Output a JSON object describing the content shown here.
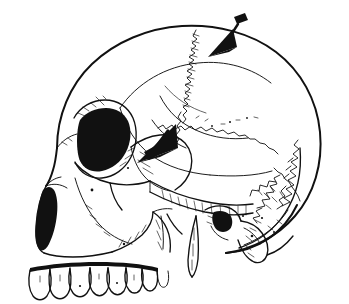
{
  "figure": {
    "kind": "anatomical-line-drawing",
    "view": "lateral (left side) view",
    "background_color": "#ffffff",
    "ink_color": "#111111",
    "width_px": 349,
    "height_px": 304,
    "has_text_labels": false,
    "caption": ""
  },
  "annotations": {
    "arrows": [
      {
        "id": "arrow-superior",
        "name": "upper-arrow",
        "points_to": "coronal suture at vertex",
        "tip_x": 222,
        "tip_y": 50,
        "tail_x": 244,
        "tail_y": 18,
        "direction": "down-left",
        "style": "solid filled triangular arrowhead with tapered tail and knob cap",
        "color": "#111111"
      },
      {
        "id": "arrow-middle",
        "name": "lower-arrow",
        "points_to": "greater wing of sphenoid / pterion region",
        "tip_x": 146,
        "tip_y": 158,
        "tail_x": 172,
        "tail_y": 126,
        "direction": "down-left",
        "style": "solid filled triangular arrowhead with short tapered tail",
        "color": "#111111"
      }
    ]
  },
  "anatomy": {
    "regions": [
      {
        "id": "frontal-bone",
        "label": "frontal bone",
        "shading": "none"
      },
      {
        "id": "parietal-bone",
        "label": "parietal bone",
        "shading": "none"
      },
      {
        "id": "occipital-bone",
        "label": "occipital bone",
        "shading": "none"
      },
      {
        "id": "temporal-bone",
        "label": "temporal bone",
        "shading": "none"
      },
      {
        "id": "orbit",
        "label": "orbital cavity",
        "shading": "dense black hatching"
      },
      {
        "id": "nasal-aperture",
        "label": "piriform (nasal) aperture",
        "shading": "dense black hatching"
      },
      {
        "id": "zygomatic-arch",
        "label": "zygomatic arch",
        "shading": "light hatching"
      },
      {
        "id": "maxilla",
        "label": "maxilla",
        "shading": "light hatching"
      },
      {
        "id": "mastoid-process",
        "label": "mastoid process",
        "shading": "light hatching"
      },
      {
        "id": "styloid-process",
        "label": "styloid process",
        "shading": "outline"
      },
      {
        "id": "teeth-row",
        "label": "maxillary dentition",
        "shading": "outline"
      }
    ],
    "sutures": [
      {
        "id": "coronal-suture",
        "label": "coronal suture",
        "pattern": "tightly serrated zigzag"
      },
      {
        "id": "squamous-suture",
        "label": "squamous suture",
        "pattern": "jagged stepped line"
      },
      {
        "id": "lambdoid-suture",
        "label": "lambdoid suture",
        "pattern": "complex wormian zigzag"
      }
    ],
    "teeth_count": 8
  }
}
